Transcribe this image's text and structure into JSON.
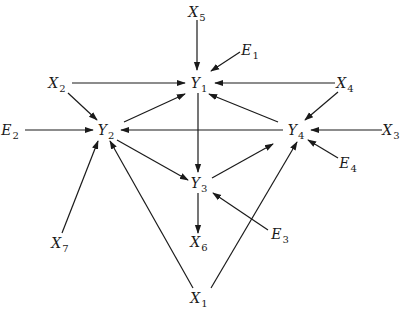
{
  "diagram": {
    "type": "path-diagram",
    "nodes": [
      {
        "id": "X5",
        "letter": "X",
        "sub": "5",
        "x": 197,
        "y": 12
      },
      {
        "id": "E1",
        "letter": "E",
        "sub": "1",
        "x": 250,
        "y": 50
      },
      {
        "id": "Y1",
        "letter": "Y",
        "sub": "1",
        "x": 199,
        "y": 83
      },
      {
        "id": "X2",
        "letter": "X",
        "sub": "2",
        "x": 57,
        "y": 83
      },
      {
        "id": "X4",
        "letter": "X",
        "sub": "4",
        "x": 345,
        "y": 83
      },
      {
        "id": "E2",
        "letter": "E",
        "sub": "2",
        "x": 10,
        "y": 130
      },
      {
        "id": "Y2",
        "letter": "Y",
        "sub": "2",
        "x": 106,
        "y": 130
      },
      {
        "id": "Y4",
        "letter": "Y",
        "sub": "4",
        "x": 296,
        "y": 130
      },
      {
        "id": "X3",
        "letter": "X",
        "sub": "3",
        "x": 391,
        "y": 130
      },
      {
        "id": "E4",
        "letter": "E",
        "sub": "4",
        "x": 348,
        "y": 163
      },
      {
        "id": "Y3",
        "letter": "Y",
        "sub": "3",
        "x": 199,
        "y": 183
      },
      {
        "id": "E3",
        "letter": "E",
        "sub": "3",
        "x": 280,
        "y": 234
      },
      {
        "id": "X6",
        "letter": "X",
        "sub": "6",
        "x": 199,
        "y": 242
      },
      {
        "id": "X7",
        "letter": "X",
        "sub": "7",
        "x": 60,
        "y": 243
      },
      {
        "id": "X1",
        "letter": "X",
        "sub": "1",
        "x": 199,
        "y": 298
      }
    ],
    "edges": [
      {
        "from": "X5",
        "to": "Y1",
        "x1": 197,
        "y1": 20,
        "x2": 197,
        "y2": 70
      },
      {
        "from": "E1",
        "to": "Y1",
        "x1": 240,
        "y1": 52,
        "x2": 211,
        "y2": 71
      },
      {
        "from": "X2",
        "to": "Y1",
        "x1": 72,
        "y1": 83,
        "x2": 185,
        "y2": 83
      },
      {
        "from": "X4",
        "to": "Y1",
        "x1": 335,
        "y1": 83,
        "x2": 215,
        "y2": 83
      },
      {
        "from": "X2",
        "to": "Y2",
        "x1": 68,
        "y1": 93,
        "x2": 97,
        "y2": 120
      },
      {
        "from": "Y2",
        "to": "Y1",
        "x1": 124,
        "y1": 122,
        "x2": 185,
        "y2": 94
      },
      {
        "from": "E2",
        "to": "Y2",
        "x1": 25,
        "y1": 130,
        "x2": 93,
        "y2": 130
      },
      {
        "from": "Y4",
        "to": "Y2",
        "x1": 283,
        "y1": 130,
        "x2": 121,
        "y2": 130
      },
      {
        "from": "Y4",
        "to": "Y1",
        "x1": 278,
        "y1": 122,
        "x2": 209,
        "y2": 94
      },
      {
        "from": "X4",
        "to": "Y4",
        "x1": 338,
        "y1": 92,
        "x2": 305,
        "y2": 120
      },
      {
        "from": "X3",
        "to": "Y4",
        "x1": 382,
        "y1": 130,
        "x2": 311,
        "y2": 130
      },
      {
        "from": "E4",
        "to": "Y4",
        "x1": 338,
        "y1": 158,
        "x2": 308,
        "y2": 140
      },
      {
        "from": "Y1",
        "to": "Y3",
        "x1": 198,
        "y1": 93,
        "x2": 198,
        "y2": 172
      },
      {
        "from": "Y2",
        "to": "Y3",
        "x1": 117,
        "y1": 140,
        "x2": 188,
        "y2": 180
      },
      {
        "from": "Y3",
        "to": "Y4",
        "x1": 212,
        "y1": 178,
        "x2": 273,
        "y2": 144
      },
      {
        "from": "E3",
        "to": "Y3",
        "x1": 268,
        "y1": 230,
        "x2": 213,
        "y2": 193
      },
      {
        "from": "Y3",
        "to": "X6",
        "x1": 198,
        "y1": 193,
        "x2": 198,
        "y2": 233
      },
      {
        "from": "X7",
        "to": "Y2",
        "x1": 62,
        "y1": 233,
        "x2": 98,
        "y2": 141
      },
      {
        "from": "X1",
        "to": "Y2",
        "x1": 193,
        "y1": 288,
        "x2": 110,
        "y2": 141
      },
      {
        "from": "X1",
        "to": "Y4",
        "x1": 211,
        "y1": 288,
        "x2": 297,
        "y2": 142
      }
    ]
  }
}
